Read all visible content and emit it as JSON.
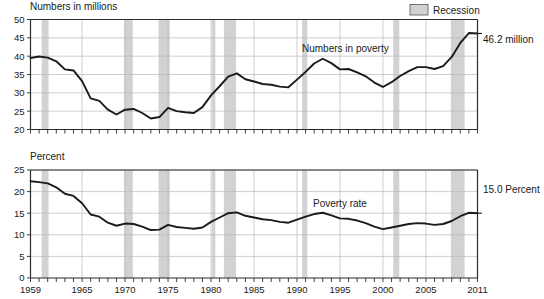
{
  "legend": {
    "recession_label": "Recession",
    "swatch_color": "#d2d2d2"
  },
  "panels": {
    "top": {
      "title": "Numbers in millions",
      "series_label": "Numbers in poverty",
      "endpoint_label": "46.2 million"
    },
    "bottom": {
      "title": "Percent",
      "series_label": "Poverty rate",
      "endpoint_label": "15.0 Percent"
    }
  },
  "chart_data": [
    {
      "type": "line",
      "title": "Numbers in millions",
      "xlabel": "",
      "ylabel": "Numbers in millions",
      "ylim": [
        20,
        50
      ],
      "yticks": [
        20,
        25,
        30,
        35,
        40,
        45,
        50
      ],
      "xlim": [
        1959,
        2011
      ],
      "xticks": [
        1959,
        1965,
        1970,
        1975,
        1980,
        1985,
        1990,
        1995,
        2000,
        2005,
        2011
      ],
      "grid": true,
      "legend_position": "top-right",
      "series": [
        {
          "name": "Numbers in poverty",
          "x": [
            1959,
            1960,
            1961,
            1962,
            1963,
            1964,
            1965,
            1966,
            1967,
            1968,
            1969,
            1970,
            1971,
            1972,
            1973,
            1974,
            1975,
            1976,
            1977,
            1978,
            1979,
            1980,
            1981,
            1982,
            1983,
            1984,
            1985,
            1986,
            1987,
            1988,
            1989,
            1990,
            1991,
            1992,
            1993,
            1994,
            1995,
            1996,
            1997,
            1998,
            1999,
            2000,
            2001,
            2002,
            2003,
            2004,
            2005,
            2006,
            2007,
            2008,
            2009,
            2010,
            2011
          ],
          "values": [
            39.5,
            39.9,
            39.6,
            38.6,
            36.4,
            36.1,
            33.2,
            28.5,
            27.8,
            25.4,
            24.1,
            25.4,
            25.6,
            24.5,
            23.0,
            23.4,
            25.9,
            25.0,
            24.7,
            24.5,
            26.1,
            29.3,
            31.8,
            34.4,
            35.3,
            33.7,
            33.1,
            32.4,
            32.2,
            31.7,
            31.5,
            33.6,
            35.7,
            38.0,
            39.3,
            38.1,
            36.4,
            36.5,
            35.6,
            34.5,
            32.8,
            31.6,
            32.9,
            34.6,
            35.9,
            37.0,
            37.0,
            36.5,
            37.3,
            39.8,
            43.6,
            46.3,
            46.2
          ],
          "endpoint_value": 46.2,
          "endpoint_label": "46.2 million"
        }
      ],
      "recessions": [
        {
          "start": 1960.3,
          "end": 1961.1
        },
        {
          "start": 1969.9,
          "end": 1970.9
        },
        {
          "start": 1973.9,
          "end": 1975.2
        },
        {
          "start": 1980.1,
          "end": 1980.5
        },
        {
          "start": 1981.5,
          "end": 1982.9
        },
        {
          "start": 1990.6,
          "end": 1991.2
        },
        {
          "start": 2001.2,
          "end": 2001.9
        },
        {
          "start": 2007.9,
          "end": 2009.5
        }
      ]
    },
    {
      "type": "line",
      "title": "Percent",
      "xlabel": "",
      "ylabel": "Percent",
      "ylim": [
        0,
        25
      ],
      "yticks": [
        0,
        5,
        10,
        15,
        20,
        25
      ],
      "xlim": [
        1959,
        2011
      ],
      "xticks": [
        1959,
        1965,
        1970,
        1975,
        1980,
        1985,
        1990,
        1995,
        2000,
        2005,
        2011
      ],
      "grid": true,
      "legend_position": "top-right",
      "series": [
        {
          "name": "Poverty rate",
          "x": [
            1959,
            1960,
            1961,
            1962,
            1963,
            1964,
            1965,
            1966,
            1967,
            1968,
            1969,
            1970,
            1971,
            1972,
            1973,
            1974,
            1975,
            1976,
            1977,
            1978,
            1979,
            1980,
            1981,
            1982,
            1983,
            1984,
            1985,
            1986,
            1987,
            1988,
            1989,
            1990,
            1991,
            1992,
            1993,
            1994,
            1995,
            1996,
            1997,
            1998,
            1999,
            2000,
            2001,
            2002,
            2003,
            2004,
            2005,
            2006,
            2007,
            2008,
            2009,
            2010,
            2011
          ],
          "values": [
            22.4,
            22.2,
            21.9,
            21.0,
            19.5,
            19.0,
            17.3,
            14.7,
            14.2,
            12.8,
            12.1,
            12.6,
            12.5,
            11.9,
            11.1,
            11.2,
            12.3,
            11.8,
            11.6,
            11.4,
            11.7,
            13.0,
            14.0,
            15.0,
            15.2,
            14.4,
            14.0,
            13.6,
            13.4,
            13.0,
            12.8,
            13.5,
            14.2,
            14.8,
            15.1,
            14.5,
            13.8,
            13.7,
            13.3,
            12.7,
            11.9,
            11.3,
            11.7,
            12.1,
            12.5,
            12.7,
            12.6,
            12.3,
            12.5,
            13.2,
            14.3,
            15.1,
            15.0
          ],
          "endpoint_value": 15.0,
          "endpoint_label": "15.0 Percent"
        }
      ],
      "recessions": [
        {
          "start": 1960.3,
          "end": 1961.1
        },
        {
          "start": 1969.9,
          "end": 1970.9
        },
        {
          "start": 1973.9,
          "end": 1975.2
        },
        {
          "start": 1980.1,
          "end": 1980.5
        },
        {
          "start": 1981.5,
          "end": 1982.9
        },
        {
          "start": 1990.6,
          "end": 1991.2
        },
        {
          "start": 2001.2,
          "end": 2001.9
        },
        {
          "start": 2007.9,
          "end": 2009.5
        }
      ]
    }
  ]
}
